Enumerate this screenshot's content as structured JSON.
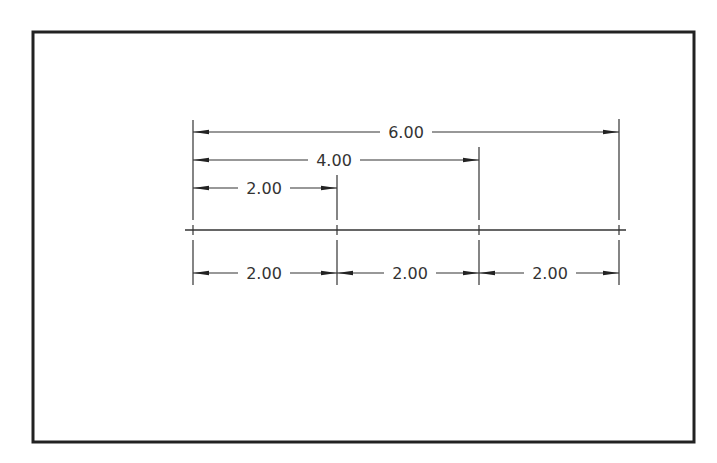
{
  "colors": {
    "background": "#ffffff",
    "frame": "#222222",
    "line": "#333333",
    "text": "#333333"
  },
  "frame": {
    "x": 33,
    "y": 32,
    "width": 661,
    "height": 410
  },
  "baseline": {
    "y": 230,
    "x1": 185,
    "x2": 626
  },
  "extension_lines": [
    {
      "x": 193,
      "y1": 120,
      "y2": 285
    },
    {
      "x": 337,
      "y1": 175,
      "y2": 285
    },
    {
      "x": 479,
      "y1": 147,
      "y2": 285
    },
    {
      "x": 619,
      "y1": 119,
      "y2": 285
    }
  ],
  "dimensions": {
    "overall": [
      {
        "label": "6.00",
        "y": 132,
        "x1": 193,
        "x2": 619,
        "text_x": 406
      },
      {
        "label": "4.00",
        "y": 160,
        "x1": 193,
        "x2": 479,
        "text_x": 334
      },
      {
        "label": "2.00",
        "y": 188,
        "x1": 193,
        "x2": 337,
        "text_x": 264
      }
    ],
    "chain": [
      {
        "label": "2.00",
        "y": 273,
        "x1": 193,
        "x2": 337,
        "text_x": 264
      },
      {
        "label": "2.00",
        "y": 273,
        "x1": 337,
        "x2": 479,
        "text_x": 410
      },
      {
        "label": "2.00",
        "y": 273,
        "x1": 479,
        "x2": 619,
        "text_x": 550
      }
    ]
  }
}
